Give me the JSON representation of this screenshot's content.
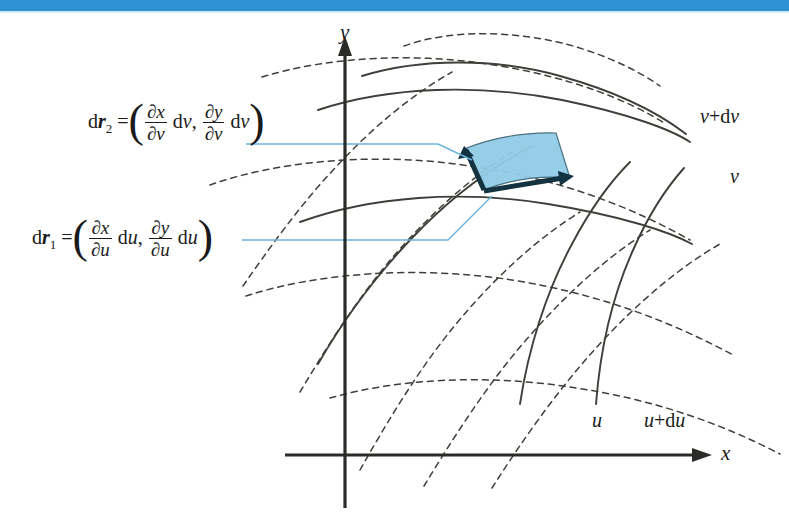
{
  "page": {
    "width": 789,
    "height": 522,
    "background": "#ffffff",
    "banner_color": "#2e93d0"
  },
  "figure": {
    "shaded_region_fill": "#8fcbe5",
    "shaded_region_stroke": "#1a3a4a",
    "leader_line_color": "#6ab4dd",
    "curve_color": "#3f3f3a",
    "axis_color": "#2b2b28"
  },
  "axes": {
    "x_label": "x",
    "y_label": "y",
    "origin_x": 345,
    "origin_y": 455
  },
  "curve_labels": [
    {
      "name": "v-plus-dv",
      "text_italic": "v",
      "text_plus": "+d",
      "text_tail": "v",
      "x": 700,
      "y": 106
    },
    {
      "name": "v",
      "text_italic": "v",
      "text_plus": "",
      "text_tail": "",
      "x": 730,
      "y": 170
    },
    {
      "name": "u",
      "text_italic": "u",
      "text_plus": "",
      "text_tail": "",
      "x": 592,
      "y": 412
    },
    {
      "name": "u-plus-du",
      "text_italic": "u",
      "text_plus": "+d",
      "text_tail": "u",
      "x": 644,
      "y": 412
    }
  ],
  "formulas": [
    {
      "name": "dr2",
      "vector": "r",
      "subscript": "2",
      "differential": "d",
      "variable": "v",
      "numerator_1": "∂x",
      "denominator_1": "∂v",
      "term_1_suffix": "dv",
      "numerator_2": "∂y",
      "denominator_2": "∂v",
      "term_2_suffix": "dv",
      "x": 88,
      "y": 100
    },
    {
      "name": "dr1",
      "vector": "r",
      "subscript": "1",
      "differential": "d",
      "variable": "u",
      "numerator_1": "∂x",
      "denominator_1": "∂u",
      "term_1_suffix": "du",
      "numerator_2": "∂y",
      "denominator_2": "∂u",
      "term_2_suffix": "du",
      "x": 32,
      "y": 216
    }
  ]
}
